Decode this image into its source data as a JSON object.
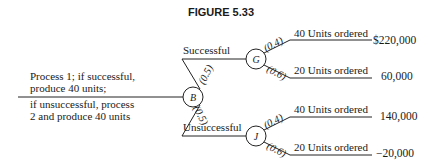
{
  "figure": {
    "title": "FIGURE 5.33"
  },
  "decision": {
    "line1": "Process 1; if successful,",
    "line2": "produce 40 units;",
    "line3": "if unsuccessful, process",
    "line4": "2 and produce 40 units"
  },
  "nodes": {
    "root": "B",
    "success": "G",
    "fail": "J"
  },
  "branches": {
    "successful": {
      "label": "Successful",
      "prob": "(0.5)"
    },
    "unsuccessful": {
      "label": "Unsuccessful",
      "prob": "(0.5)"
    }
  },
  "outcomes": [
    {
      "parent": "G",
      "prob": "(0.4)",
      "label": "40 Units ordered",
      "value": "$220,000"
    },
    {
      "parent": "G",
      "prob": "(0.6)",
      "label": "20 Units ordered",
      "value": "60,000"
    },
    {
      "parent": "J",
      "prob": "(0.4)",
      "label": "40 Units ordered",
      "value": "140,000"
    },
    {
      "parent": "J",
      "prob": "(0.6)",
      "label": "20 Units ordered",
      "value": "−20,000"
    }
  ]
}
